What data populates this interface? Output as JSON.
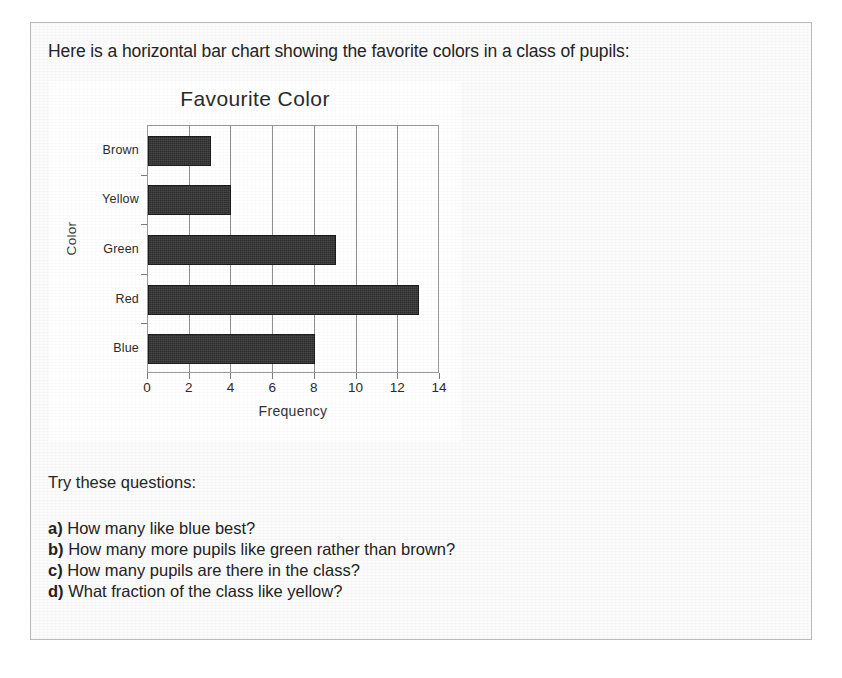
{
  "page": {
    "intro_text": "Here is a horizontal bar chart showing the favorite colors in a class of pupils:",
    "questions_intro": "Try these questions:",
    "questions": [
      {
        "key": "a)",
        "text": "How many like blue best?"
      },
      {
        "key": "b)",
        "text": "How many more pupils like green rather than brown?"
      },
      {
        "key": "c)",
        "text": "How many pupils are there in the class?"
      },
      {
        "key": "d)",
        "text": "What fraction of the class like yellow?"
      }
    ]
  },
  "colors": {
    "bar_fill": "#2d2d2d",
    "plot_border": "#9a9a9a",
    "gridline": "#8f8f8f",
    "text": "#232323",
    "panel_background": "#fbfbfb",
    "chart_background": "#ffffff"
  },
  "chart_data": {
    "type": "bar",
    "orientation": "horizontal",
    "title": "Favourite Color",
    "xlabel": "Frequency",
    "ylabel": "Color",
    "categories": [
      "Blue",
      "Red",
      "Green",
      "Yellow",
      "Brown"
    ],
    "values": [
      8,
      13,
      9,
      4,
      3
    ],
    "category_order_top_to_bottom": [
      "Brown",
      "Yellow",
      "Green",
      "Red",
      "Blue"
    ],
    "xlim": [
      0,
      14
    ],
    "xticks": [
      0,
      2,
      4,
      6,
      8,
      10,
      12,
      14
    ],
    "xtick_labels": [
      "0",
      "2",
      "4",
      "6",
      "8",
      "10",
      "12",
      "14"
    ],
    "grid": "vertical",
    "legend": "none"
  }
}
